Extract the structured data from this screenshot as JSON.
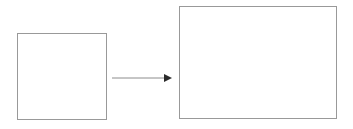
{
  "diagram": {
    "title": "Transformation diagram: small square maps to larger rectangle",
    "background_color": "#ffffff",
    "canvas": {
      "width": 353,
      "height": 129
    },
    "stroke_color": "#999999",
    "arrow_line_color": "#8c8c8c",
    "arrow_head_color": "#2b2b2b",
    "stroke_width": 1,
    "shapes": [
      {
        "id": "source-square",
        "name": "small square",
        "type": "rectangle",
        "label": "",
        "x": 17,
        "y": 33,
        "width": 90,
        "height": 87,
        "fill": "none",
        "stroke": "#999999"
      },
      {
        "id": "target-rectangle",
        "name": "large rectangle",
        "type": "rectangle",
        "label": "",
        "x": 179,
        "y": 6,
        "width": 158,
        "height": 113,
        "fill": "none",
        "stroke": "#999999"
      }
    ],
    "connector": {
      "id": "transform-arrow",
      "name": "arrow",
      "type": "arrow",
      "label": "",
      "direction": "right",
      "from_shape": "source-square",
      "to_shape": "target-rectangle",
      "x1": 112,
      "y1": 78,
      "x2": 172,
      "y2": 78,
      "line_color": "#8c8c8c",
      "head_color": "#2b2b2b",
      "head_width": 8,
      "head_height": 8
    }
  }
}
